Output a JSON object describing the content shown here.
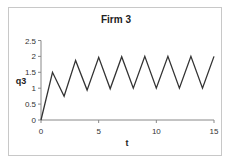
{
  "chart_data": {
    "type": "line",
    "title": "Firm 3",
    "xlabel": "t",
    "ylabel": "q3",
    "xlim": [
      0,
      15
    ],
    "ylim": [
      0,
      2.5
    ],
    "x_ticks": [
      "0",
      "5",
      "10",
      "15"
    ],
    "y_ticks": [
      "0",
      "0.5",
      "1",
      "1.5",
      "2",
      "2.5"
    ],
    "grid": false,
    "legend": null,
    "series": [
      {
        "name": "q3",
        "color": "#333333",
        "x": [
          0,
          1,
          2,
          3,
          4,
          5,
          6,
          7,
          8,
          9,
          10,
          11,
          12,
          13,
          14,
          15
        ],
        "values": [
          0,
          1.5,
          0.75,
          1.875,
          0.94,
          1.97,
          0.98,
          1.99,
          1.0,
          2.0,
          1.0,
          2.0,
          1.0,
          2.0,
          1.0,
          2.0
        ]
      }
    ]
  }
}
